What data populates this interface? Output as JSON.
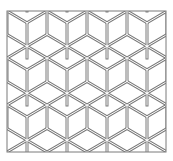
{
  "figure": {
    "pattern": "isometric-cubes",
    "colors": {
      "background": "#ffffff",
      "line": "#7a7a7a",
      "gap": "#ffffff"
    },
    "frame": {
      "x": 7,
      "y": 11,
      "width": 159,
      "height": 141
    },
    "tile": {
      "width": 40,
      "height": 47
    }
  }
}
